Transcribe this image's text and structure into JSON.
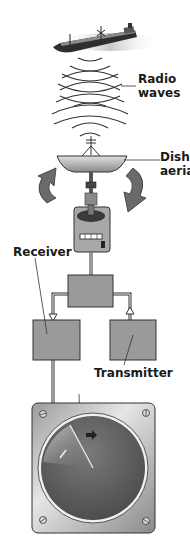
{
  "diagram": {
    "labels": {
      "radio_waves_line1": "Radio",
      "radio_waves_line2": "waves",
      "dish_line1": "Dish",
      "dish_line2": "aerial",
      "receiver": "Receiver",
      "transmitter": "Transmitter"
    },
    "components": [
      "ship",
      "radio-waves",
      "dish-aerial",
      "rotation-arrows",
      "motor-unit",
      "duplexer-box",
      "receiver-box",
      "transmitter-box",
      "radar-display"
    ],
    "colors": {
      "box_fill": "#9a9a9a",
      "line": "#2a2a2a",
      "screen": "#5a5a5a",
      "panel": "#c8c8c8"
    }
  }
}
